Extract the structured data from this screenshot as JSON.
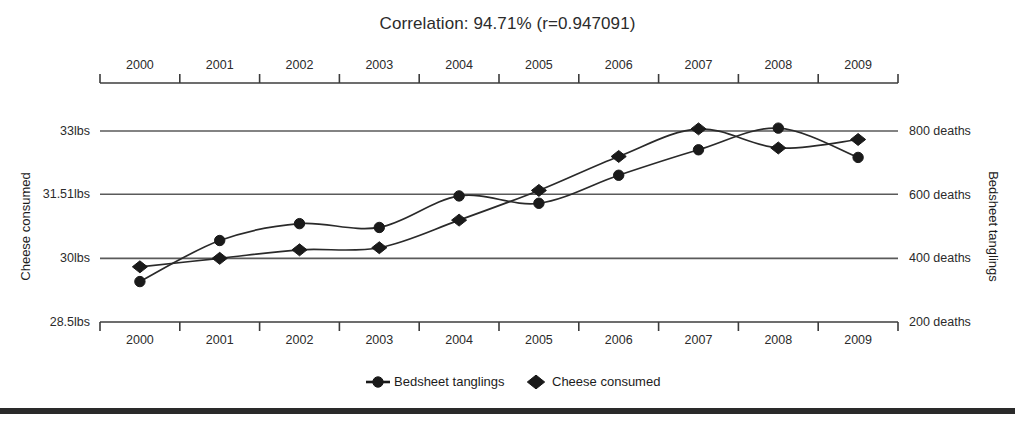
{
  "chart_data": {
    "type": "line",
    "title": "Correlation: 94.71% (r=0.947091)",
    "categories": [
      "2000",
      "2001",
      "2002",
      "2003",
      "2004",
      "2005",
      "2006",
      "2007",
      "2008",
      "2009"
    ],
    "x": [
      2000,
      2001,
      2002,
      2003,
      2004,
      2005,
      2006,
      2007,
      2008,
      2009
    ],
    "grid": true,
    "legend_position": "bottom",
    "series": [
      {
        "name": "Bedsheet tanglings",
        "marker": "circle",
        "axis": "right",
        "unit": "deaths",
        "values": [
          327,
          456,
          509,
          497,
          596,
          573,
          661,
          741,
          809,
          717
        ]
      },
      {
        "name": "Cheese consumed",
        "marker": "diamond",
        "axis": "left",
        "unit": "lbs",
        "values": [
          29.8,
          30.0,
          30.2,
          30.25,
          30.9,
          31.6,
          32.4,
          33.05,
          32.6,
          32.8
        ]
      }
    ],
    "left_axis": {
      "label": "Cheese consumed",
      "tick_labels": [
        "33lbs",
        "31.51lbs",
        "30lbs",
        "28.5lbs"
      ],
      "tick_values": [
        33,
        31.51,
        30,
        28.5
      ],
      "min": 28.5,
      "max": 33
    },
    "right_axis": {
      "label": "Bedsheet tanglings",
      "tick_labels": [
        "800 deaths",
        "600 deaths",
        "400 deaths",
        "200 deaths"
      ],
      "tick_values": [
        800,
        600,
        400,
        200
      ],
      "min": 200,
      "max": 800
    },
    "top_axis": {
      "tick_labels": [
        "2000",
        "2001",
        "2002",
        "2003",
        "2004",
        "2005",
        "2006",
        "2007",
        "2008",
        "2009"
      ]
    },
    "bottom_axis": {
      "tick_labels": [
        "2000",
        "2001",
        "2002",
        "2003",
        "2004",
        "2005",
        "2006",
        "2007",
        "2008",
        "2009"
      ]
    },
    "legend": [
      {
        "label": "Bedsheet tanglings",
        "marker": "circle"
      },
      {
        "label": "Cheese consumed",
        "marker": "diamond"
      }
    ],
    "colors": {
      "line": "#2a2a2a",
      "grid": "#5a5a5a",
      "text": "#1c1c1c",
      "background": "#ffffff"
    }
  }
}
